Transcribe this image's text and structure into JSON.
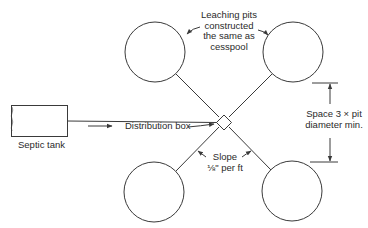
{
  "diagram": {
    "type": "septic leaching pit layout (plan view)",
    "labels": {
      "septic_tank": "Septic tank",
      "distribution_box": "Distribution box",
      "leaching_pits_line1": "Leaching pits",
      "leaching_pits_line2": "constructed",
      "leaching_pits_line3": "the same as",
      "leaching_pits_line4": "cesspool",
      "spacing_line1": "Space 3 × pit",
      "spacing_line2": "diameter min.",
      "slope_line1": "Slope",
      "slope_line2": "⅛\" per ft"
    },
    "components": [
      {
        "id": "septic-tank",
        "kind": "rectangle"
      },
      {
        "id": "distribution-box",
        "kind": "diamond"
      },
      {
        "id": "pit-top-left",
        "kind": "circle"
      },
      {
        "id": "pit-top-right",
        "kind": "circle"
      },
      {
        "id": "pit-bottom-left",
        "kind": "circle"
      },
      {
        "id": "pit-bottom-right",
        "kind": "circle"
      }
    ],
    "colors": {
      "line": "#3a3a3a",
      "background": "#ffffff"
    }
  }
}
